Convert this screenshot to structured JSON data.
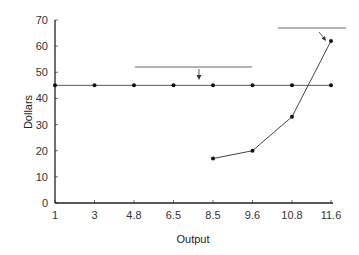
{
  "chart_data": {
    "type": "line",
    "title": "",
    "xlabel": "Output",
    "ylabel": "Dollars",
    "ylim": [
      0,
      70
    ],
    "grid": false,
    "legend": null,
    "categories": [
      "1",
      "3",
      "4.8",
      "6.5",
      "8.5",
      "9.6",
      "10.8",
      "11.6"
    ],
    "y_ticks": [
      0,
      10,
      20,
      30,
      40,
      50,
      60,
      70
    ],
    "series": [
      {
        "name": "flat-line",
        "values": [
          45,
          45,
          45,
          45,
          45,
          45,
          45,
          45
        ]
      },
      {
        "name": "rising-curve",
        "values": [
          null,
          null,
          null,
          null,
          17,
          20,
          33,
          62
        ]
      }
    ],
    "annotations": [
      {
        "type": "bar-with-arrow",
        "x_range": [
          "4.8",
          "9.6"
        ],
        "y": 52,
        "arrow_to": {
          "x": "7.6",
          "y": 46
        }
      },
      {
        "type": "bar-with-arrow",
        "x_range": [
          "10.8",
          "11.6+"
        ],
        "y": 67,
        "arrow_to": {
          "x": "11.6",
          "y": 62
        }
      }
    ]
  },
  "axes": {
    "x_title": "Output",
    "y_title": "Dollars"
  }
}
